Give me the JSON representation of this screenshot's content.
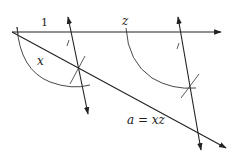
{
  "diagram": {
    "labels": {
      "unit": "1",
      "z": "z",
      "x": "x",
      "result": "a = xz"
    },
    "colors": {
      "stroke": "#222222",
      "arc": "#333333",
      "background": "#ffffff"
    },
    "elements": [
      {
        "id": "base-line",
        "type": "ray",
        "from": [
          12,
          32
        ],
        "to": [
          221,
          32
        ],
        "arrow": "end"
      },
      {
        "id": "diagonal-line",
        "type": "ray",
        "from": [
          12,
          32
        ],
        "to": [
          226,
          148
        ],
        "arrow": "end"
      },
      {
        "id": "parallel-line-1",
        "type": "line",
        "from": [
          68,
          17
        ],
        "to": [
          88,
          114
        ],
        "arrow": "both"
      },
      {
        "id": "parallel-line-2",
        "type": "line",
        "from": [
          178,
          17
        ],
        "to": [
          201,
          150
        ],
        "arrow": "both"
      },
      {
        "id": "arc-1",
        "type": "arc",
        "center": [
          12,
          32
        ]
      },
      {
        "id": "arc-2",
        "type": "arc",
        "center": [
          126,
          32
        ]
      }
    ]
  }
}
